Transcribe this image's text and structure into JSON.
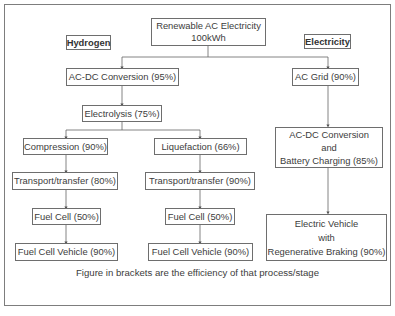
{
  "diagram": {
    "source": {
      "line1": "Renewable AC Electricity",
      "line2": "100kWh"
    },
    "labels": {
      "hydrogen": "Hydrogen",
      "electricity": "Electricity"
    },
    "hydrogen_path": {
      "acdc": "AC-DC Conversion (95%)",
      "electrolysis": "Electrolysis (75%)",
      "compression_branch": [
        "Compression (90%)",
        "Transport/transfer (80%)",
        "Fuel Cell (50%)",
        "Fuel Cell Vehicle (90%)"
      ],
      "liquefaction_branch": [
        "Liquefaction (66%)",
        "Transport/transfer (90%)",
        "Fuel Cell (50%)",
        "Fuel Cell Vehicle (90%)"
      ]
    },
    "electricity_path": {
      "grid": "AC Grid (90%)",
      "charging": {
        "line1": "AC-DC Conversion",
        "line2": "and",
        "line3": "Battery Charging (85%)"
      },
      "vehicle": {
        "line1": "Electric Vehicle",
        "line2": "with",
        "line3": "Regenerative Braking (90%)"
      }
    },
    "caption": "Figure in brackets are the efficiency of that process/stage"
  }
}
